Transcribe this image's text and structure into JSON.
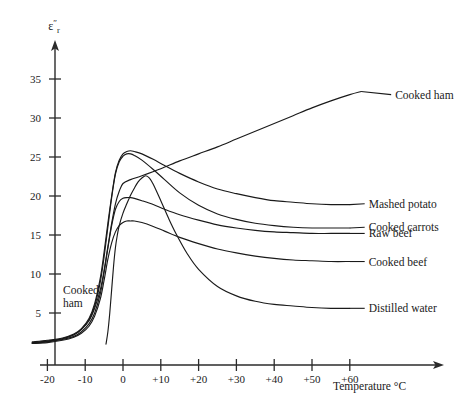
{
  "chart_data": {
    "type": "line",
    "title": "",
    "xlabel": "Temperature °C",
    "ylabel": "ε″r",
    "ylabel_base": "ε",
    "ylabel_sup": "″",
    "ylabel_sub": "r",
    "xlim": [
      -25,
      68
    ],
    "ylim": [
      0,
      37
    ],
    "xticks": [
      -20,
      -10,
      0,
      10,
      20,
      30,
      40,
      50,
      60
    ],
    "xtick_labels": [
      "-20",
      "-10",
      "0",
      "+10",
      "+20",
      "+30",
      "+40",
      "+50",
      "+60"
    ],
    "yticks": [
      5,
      10,
      15,
      20,
      25,
      30,
      35
    ],
    "ytick_labels": [
      "5",
      "10",
      "15",
      "20",
      "25",
      "30",
      "35"
    ],
    "grid": false,
    "legend_position": "right-inline-labels",
    "annotations": [
      {
        "text": "Cooked ham",
        "x": -21,
        "y": 8.2,
        "note": "inline label near left axis, two lines"
      }
    ],
    "series": [
      {
        "name": "Cooked ham",
        "label": "Cooked ham",
        "label_x": 72,
        "label_y": 33.0,
        "points": [
          [
            -24,
            1.2
          ],
          [
            -20,
            1.4
          ],
          [
            -16,
            1.7
          ],
          [
            -13,
            2.2
          ],
          [
            -11,
            2.9
          ],
          [
            -9,
            4.0
          ],
          [
            -7.5,
            5.6
          ],
          [
            -6,
            8.0
          ],
          [
            -5,
            10.5
          ],
          [
            -4,
            13.5
          ],
          [
            -3,
            16.5
          ],
          [
            -2,
            19.0
          ],
          [
            -1,
            20.6
          ],
          [
            0,
            21.6
          ],
          [
            2,
            22.1
          ],
          [
            5,
            22.6
          ],
          [
            10,
            23.5
          ],
          [
            15,
            24.5
          ],
          [
            20,
            25.4
          ],
          [
            25,
            26.3
          ],
          [
            30,
            27.3
          ],
          [
            35,
            28.3
          ],
          [
            40,
            29.3
          ],
          [
            45,
            30.3
          ],
          [
            50,
            31.3
          ],
          [
            55,
            32.2
          ],
          [
            60,
            33.0
          ],
          [
            63,
            33.4
          ]
        ]
      },
      {
        "name": "Mashed potato",
        "label": "Mashed potato",
        "label_x": 65,
        "label_y": 19.0,
        "points": [
          [
            -24,
            1.3
          ],
          [
            -20,
            1.5
          ],
          [
            -16,
            1.8
          ],
          [
            -13,
            2.3
          ],
          [
            -11,
            3.0
          ],
          [
            -9,
            4.3
          ],
          [
            -7.5,
            6.2
          ],
          [
            -6,
            9.5
          ],
          [
            -5,
            12.8
          ],
          [
            -4,
            16.5
          ],
          [
            -3,
            20.0
          ],
          [
            -2,
            23.0
          ],
          [
            -1,
            24.6
          ],
          [
            0,
            25.4
          ],
          [
            1,
            25.7
          ],
          [
            2,
            25.8
          ],
          [
            3,
            25.7
          ],
          [
            5,
            25.4
          ],
          [
            8,
            24.7
          ],
          [
            11,
            23.9
          ],
          [
            15,
            22.9
          ],
          [
            20,
            21.8
          ],
          [
            25,
            20.9
          ],
          [
            30,
            20.3
          ],
          [
            35,
            19.8
          ],
          [
            40,
            19.4
          ],
          [
            45,
            19.2
          ],
          [
            50,
            19.0
          ],
          [
            55,
            18.9
          ],
          [
            60,
            18.9
          ]
        ]
      },
      {
        "name": "Cooked carrots",
        "label": "Cooked carrots",
        "label_x": 65,
        "label_y": 16.0,
        "points": [
          [
            -24,
            1.2
          ],
          [
            -20,
            1.4
          ],
          [
            -16,
            1.7
          ],
          [
            -13,
            2.2
          ],
          [
            -11,
            2.9
          ],
          [
            -9,
            4.1
          ],
          [
            -7.5,
            5.9
          ],
          [
            -6,
            9.0
          ],
          [
            -5,
            12.2
          ],
          [
            -4,
            16.0
          ],
          [
            -3,
            19.8
          ],
          [
            -2,
            22.8
          ],
          [
            -1,
            24.4
          ],
          [
            0,
            25.1
          ],
          [
            1,
            25.4
          ],
          [
            2,
            25.4
          ],
          [
            3,
            25.2
          ],
          [
            5,
            24.6
          ],
          [
            8,
            23.4
          ],
          [
            11,
            22.1
          ],
          [
            15,
            20.4
          ],
          [
            20,
            18.8
          ],
          [
            25,
            17.7
          ],
          [
            30,
            17.0
          ],
          [
            35,
            16.5
          ],
          [
            40,
            16.2
          ],
          [
            45,
            16.0
          ],
          [
            50,
            15.9
          ],
          [
            55,
            15.9
          ],
          [
            60,
            15.9
          ]
        ]
      },
      {
        "name": "Raw beef",
        "label": "Raw beef",
        "label_x": 65,
        "label_y": 15.2,
        "points": [
          [
            -24,
            1.1
          ],
          [
            -20,
            1.3
          ],
          [
            -16,
            1.6
          ],
          [
            -13,
            2.0
          ],
          [
            -11,
            2.6
          ],
          [
            -9,
            3.6
          ],
          [
            -7.5,
            5.0
          ],
          [
            -6,
            7.5
          ],
          [
            -5,
            10.2
          ],
          [
            -4,
            13.3
          ],
          [
            -3,
            16.2
          ],
          [
            -2,
            18.3
          ],
          [
            -1,
            19.3
          ],
          [
            0,
            19.7
          ],
          [
            1,
            19.8
          ],
          [
            2,
            19.8
          ],
          [
            3,
            19.7
          ],
          [
            5,
            19.4
          ],
          [
            8,
            18.9
          ],
          [
            11,
            18.3
          ],
          [
            15,
            17.6
          ],
          [
            20,
            16.9
          ],
          [
            25,
            16.3
          ],
          [
            30,
            15.9
          ],
          [
            35,
            15.6
          ],
          [
            40,
            15.4
          ],
          [
            45,
            15.3
          ],
          [
            50,
            15.2
          ],
          [
            55,
            15.2
          ],
          [
            60,
            15.2
          ]
        ]
      },
      {
        "name": "Cooked beef",
        "label": "Cooked beef",
        "label_x": 65,
        "label_y": 11.6,
        "points": [
          [
            -24,
            1.1
          ],
          [
            -20,
            1.2
          ],
          [
            -16,
            1.5
          ],
          [
            -13,
            1.9
          ],
          [
            -11,
            2.4
          ],
          [
            -9,
            3.3
          ],
          [
            -7.5,
            4.6
          ],
          [
            -6,
            6.8
          ],
          [
            -5,
            9.2
          ],
          [
            -4,
            11.9
          ],
          [
            -3,
            14.0
          ],
          [
            -2,
            15.4
          ],
          [
            -1,
            16.2
          ],
          [
            0,
            16.6
          ],
          [
            1,
            16.8
          ],
          [
            2,
            16.8
          ],
          [
            3,
            16.8
          ],
          [
            5,
            16.6
          ],
          [
            8,
            16.1
          ],
          [
            11,
            15.5
          ],
          [
            15,
            14.7
          ],
          [
            20,
            13.9
          ],
          [
            25,
            13.2
          ],
          [
            30,
            12.7
          ],
          [
            35,
            12.3
          ],
          [
            40,
            12.0
          ],
          [
            45,
            11.8
          ],
          [
            50,
            11.7
          ],
          [
            55,
            11.6
          ],
          [
            60,
            11.6
          ]
        ]
      },
      {
        "name": "Distilled water",
        "label": "Distilled water",
        "label_x": 65,
        "label_y": 5.6,
        "points": [
          [
            -4.5,
            1.0
          ],
          [
            -4,
            2.6
          ],
          [
            -3.5,
            5.0
          ],
          [
            -3,
            8.0
          ],
          [
            -2.5,
            11.0
          ],
          [
            -2,
            13.4
          ],
          [
            -1.5,
            15.0
          ],
          [
            -1,
            16.2
          ],
          [
            0,
            17.8
          ],
          [
            1,
            19.0
          ],
          [
            2,
            20.1
          ],
          [
            3,
            21.0
          ],
          [
            4,
            21.8
          ],
          [
            5,
            22.3
          ],
          [
            6,
            22.6
          ],
          [
            7,
            22.3
          ],
          [
            8,
            21.5
          ],
          [
            10,
            19.4
          ],
          [
            12,
            17.2
          ],
          [
            14,
            15.2
          ],
          [
            17,
            12.6
          ],
          [
            20,
            10.6
          ],
          [
            25,
            8.4
          ],
          [
            30,
            7.2
          ],
          [
            35,
            6.5
          ],
          [
            40,
            6.1
          ],
          [
            45,
            5.9
          ],
          [
            50,
            5.7
          ],
          [
            55,
            5.6
          ],
          [
            60,
            5.6
          ]
        ]
      }
    ]
  }
}
